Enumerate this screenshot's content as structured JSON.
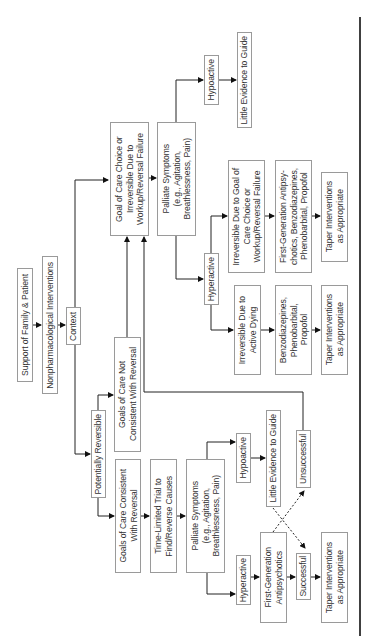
{
  "diagram": {
    "orientation": "rotated-90-ccw",
    "nodes": {
      "support": "Support of Family & Patient",
      "nonpharm": "Nonpharmacological Interventions",
      "context": "Context",
      "goal_choice": "Goal of Care Choice or\nIrreversible Due to\nWorkup/Reversal Failure",
      "palliate_top": "Palliate Symptoms\n(e.g., Agitation,\nBreathlessness, Pain)",
      "hypoactive_top": "Hypoactive",
      "little_evidence_top": "Little Evidence to Guide",
      "hyperactive_mid": "Hyperactive",
      "irreversible_goal": "Irreversible Due to Goal of\nCare Choice or\nWorkup/Reversal Failure",
      "first_gen_mid": "First-Generation Antipsy-\nchotics, Benzodiazepines,\nPhenobarbital, Propofol",
      "taper_mid": "Taper Interventions\nas Appropriate",
      "irreversible_dying": "Irreversible Due to\nActive Dying",
      "benzo": "Benzodiazepines,\nPhenobarbital,\nPropofol",
      "taper_dying": "Taper Interventions\nas Appropriate",
      "goals_not": "Goals of Care Not\nConsistent With Reversal",
      "potentially_reversible": "Potentially Reversible",
      "goals_consistent": "Goals of Care Consistent\nWith Reversal",
      "time_limited": "Time-Limited Trial to\nFind/Reverse Causes",
      "palliate_bottom": "Palliate Symptoms\n(e.g., Agitation,\nBreathlessness, Pain)",
      "hypoactive_bottom": "Hypoactive",
      "little_evidence_bottom": "Little Evidence to Guide",
      "unsuccessful": "Unsuccessful",
      "hyperactive_bottom": "Hyperactive",
      "first_gen_bottom": "First-Generation\nAntipsychotics",
      "successful": "Successful",
      "taper_bottom": "Taper Interventions\nas Appropriate"
    }
  }
}
